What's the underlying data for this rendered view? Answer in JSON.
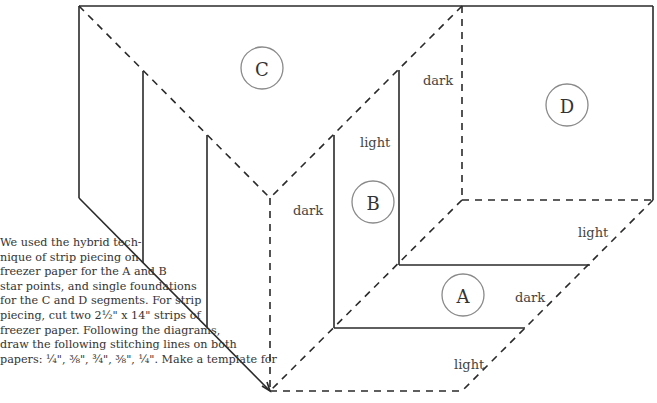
{
  "diagram": {
    "segments": {
      "A": {
        "label": "A",
        "cx": 463,
        "cy": 295
      },
      "B": {
        "label": "B",
        "cx": 373,
        "cy": 202
      },
      "C": {
        "label": "C",
        "cx": 262,
        "cy": 68
      },
      "D": {
        "label": "D",
        "cx": 567,
        "cy": 105
      }
    },
    "shade_labels": [
      {
        "text": "dark",
        "x": 423,
        "y": 85
      },
      {
        "text": "light",
        "x": 360,
        "y": 147
      },
      {
        "text": "dark",
        "x": 293,
        "y": 215
      },
      {
        "text": "light",
        "x": 578,
        "y": 237
      },
      {
        "text": "dark",
        "x": 515,
        "y": 302
      },
      {
        "text": "light",
        "x": 454,
        "y": 369
      }
    ]
  },
  "caption": {
    "lines": [
      "We used the hybrid tech-",
      "nique of strip piecing on",
      "freezer paper for the A and B",
      "star points, and single foundations",
      "for the C and D segments. For strip",
      "piecing, cut two 2½\" x 14\" strips of",
      "freezer paper. Following the diagrams,",
      "draw the following stitching lines on both",
      "papers: ¼\", ⅜\", ¾\", ⅜\", ¼\". Make a template for"
    ]
  }
}
